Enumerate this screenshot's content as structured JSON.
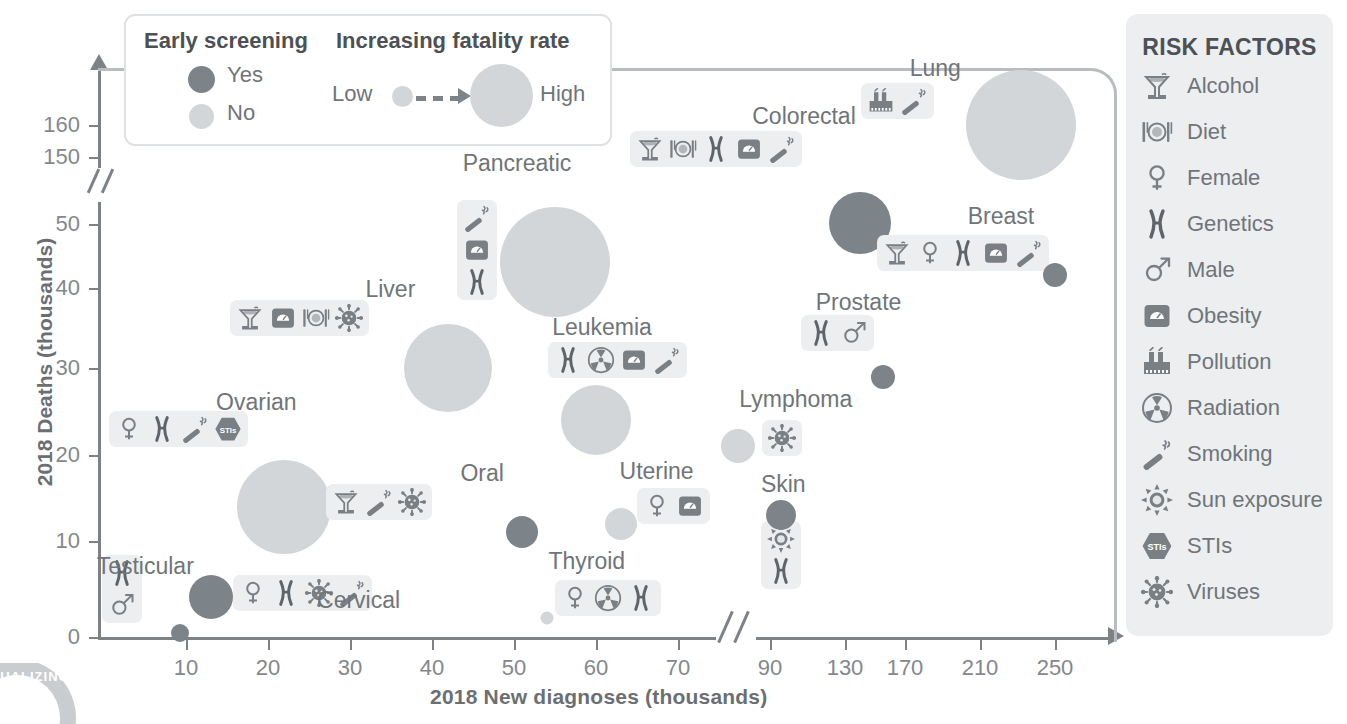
{
  "chart_data": {
    "type": "scatter",
    "title": "",
    "xlabel": "2018 New diagnoses (thousands)",
    "ylabel": "2018 Deaths (thousands)",
    "x_ticks": [
      "10",
      "20",
      "30",
      "40",
      "50",
      "60",
      "70",
      "90",
      "130",
      "170",
      "210",
      "250"
    ],
    "y_ticks": [
      "0",
      "10",
      "20",
      "30",
      "40",
      "50",
      "150",
      "160"
    ],
    "x_axis_break": true,
    "y_axis_break": true,
    "grid": false,
    "legend_position": "top-left",
    "bubble_meaning": "bubble size encodes fatality rate; fill color encodes early screening availability",
    "points": [
      {
        "label": "Testicular",
        "x": 9.3,
        "y": 0.4,
        "diagnoses": 9.3,
        "deaths": 0.4,
        "screening": "Yes",
        "fatality": "low",
        "risk_factors": [
          "Genetics",
          "Male"
        ]
      },
      {
        "label": "Cervical",
        "x": 13,
        "y": 4.2,
        "diagnoses": 13,
        "deaths": 4.2,
        "screening": "Yes",
        "fatality": "medium",
        "risk_factors": [
          "Female",
          "Genetics",
          "Viruses",
          "Smoking"
        ]
      },
      {
        "label": "Ovarian",
        "x": 22,
        "y": 14,
        "diagnoses": 22,
        "deaths": 14,
        "screening": "No",
        "fatality": "high",
        "risk_factors": [
          "Female",
          "Genetics",
          "Smoking",
          "STIs"
        ]
      },
      {
        "label": "Liver",
        "x": 42,
        "y": 30,
        "diagnoses": 42,
        "deaths": 30,
        "screening": "No",
        "fatality": "high",
        "risk_factors": [
          "Alcohol",
          "Obesity",
          "Diet",
          "Viruses"
        ]
      },
      {
        "label": "Pancreatic",
        "x": 55,
        "y": 44,
        "diagnoses": 55,
        "deaths": 44,
        "screening": "No",
        "fatality": "very high",
        "risk_factors": [
          "Smoking",
          "Obesity",
          "Genetics"
        ]
      },
      {
        "label": "Oral",
        "x": 51,
        "y": 11,
        "diagnoses": 51,
        "deaths": 11,
        "screening": "Yes",
        "fatality": "medium",
        "risk_factors": [
          "Alcohol",
          "Smoking",
          "Viruses"
        ]
      },
      {
        "label": "Thyroid",
        "x": 54,
        "y": 2,
        "diagnoses": 54,
        "deaths": 2,
        "screening": "No",
        "fatality": "low",
        "risk_factors": [
          "Female",
          "Radiation",
          "Genetics"
        ]
      },
      {
        "label": "Leukemia",
        "x": 60,
        "y": 24,
        "diagnoses": 60,
        "deaths": 24,
        "screening": "No",
        "fatality": "high",
        "risk_factors": [
          "Genetics",
          "Radiation",
          "Obesity",
          "Smoking"
        ]
      },
      {
        "label": "Uterine",
        "x": 63,
        "y": 12,
        "diagnoses": 63,
        "deaths": 12,
        "screening": "No",
        "fatality": "medium",
        "risk_factors": [
          "Female",
          "Obesity"
        ]
      },
      {
        "label": "Lymphoma",
        "x": 83,
        "y": 21,
        "diagnoses": 83,
        "deaths": 21,
        "screening": "No",
        "fatality": "medium",
        "risk_factors": [
          "Viruses"
        ]
      },
      {
        "label": "Skin",
        "x": 96,
        "y": 13,
        "diagnoses": 96,
        "deaths": 13,
        "screening": "Yes",
        "fatality": "low",
        "risk_factors": [
          "Sun exposure",
          "Genetics"
        ]
      },
      {
        "label": "Colorectal",
        "x": 140,
        "y": 51,
        "diagnoses": 140,
        "deaths": 51,
        "screening": "Yes",
        "fatality": "high",
        "risk_factors": [
          "Alcohol",
          "Diet",
          "Genetics",
          "Obesity",
          "Smoking"
        ]
      },
      {
        "label": "Prostate",
        "x": 155,
        "y": 29,
        "diagnoses": 155,
        "deaths": 29,
        "screening": "Yes",
        "fatality": "low",
        "risk_factors": [
          "Genetics",
          "Male"
        ]
      },
      {
        "label": "Lung",
        "x": 232,
        "y": 160,
        "diagnoses": 232,
        "deaths": 160,
        "screening": "No",
        "fatality": "very high",
        "risk_factors": [
          "Pollution",
          "Smoking"
        ]
      },
      {
        "label": "Breast",
        "x": 266,
        "y": 42,
        "diagnoses": 266,
        "deaths": 42,
        "screening": "Yes",
        "fatality": "low",
        "risk_factors": [
          "Alcohol",
          "Female",
          "Genetics",
          "Obesity",
          "Smoking"
        ]
      }
    ],
    "colors": {
      "screening_yes": "#7d8489",
      "screening_no": "#d3d6d8",
      "axis": "#7d8287",
      "text": "#6f7579",
      "panel": "#eceef0"
    }
  },
  "legend": {
    "screening_title": "Early screening",
    "screening_yes": "Yes",
    "screening_no": "No",
    "fatality_title": "Increasing fatality rate",
    "fatality_low": "Low",
    "fatality_high": "High"
  },
  "risk_panel": {
    "title": "RISK FACTORS",
    "items": [
      {
        "icon": "alcohol-icon",
        "label": "Alcohol"
      },
      {
        "icon": "diet-icon",
        "label": "Diet"
      },
      {
        "icon": "female-icon",
        "label": "Female"
      },
      {
        "icon": "genetics-icon",
        "label": "Genetics"
      },
      {
        "icon": "male-icon",
        "label": "Male"
      },
      {
        "icon": "obesity-icon",
        "label": "Obesity"
      },
      {
        "icon": "pollution-icon",
        "label": "Pollution"
      },
      {
        "icon": "radiation-icon",
        "label": "Radiation"
      },
      {
        "icon": "smoking-icon",
        "label": "Smoking"
      },
      {
        "icon": "sun-exposure-icon",
        "label": "Sun exposure"
      },
      {
        "icon": "stis-icon",
        "label": "STIs"
      },
      {
        "icon": "viruses-icon",
        "label": "Viruses"
      }
    ]
  },
  "watermark": {
    "text": "VISUALIZING"
  }
}
